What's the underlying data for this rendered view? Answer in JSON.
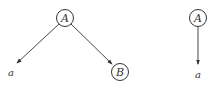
{
  "diagram": {
    "left_tree": {
      "root": {
        "label": "A",
        "cx": 65,
        "cy": 18
      },
      "leaf_a": {
        "label": "a",
        "x": 12,
        "y": 74
      },
      "child_b": {
        "label": "B",
        "cx": 120,
        "cy": 72
      }
    },
    "right_tree": {
      "root": {
        "label": "A",
        "cx": 198,
        "cy": 18
      },
      "leaf_a": {
        "label": "a",
        "x": 198,
        "y": 76
      }
    },
    "colors": {
      "stroke": "#333333",
      "background": "#ffffff"
    }
  }
}
